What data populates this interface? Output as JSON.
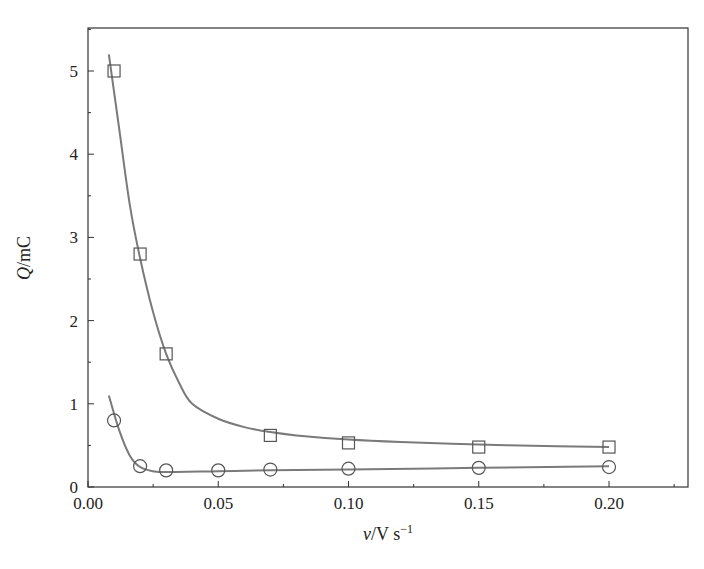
{
  "chart_data": {
    "type": "scatter",
    "title": "",
    "xlabel": "v/V s-1",
    "xlabel_parts": {
      "var": "ν",
      "unit": "/V s",
      "sup": "−1"
    },
    "ylabel": "Q/mC",
    "ylabel_parts": {
      "var": "Q",
      "unit": "/mC"
    },
    "xlim": [
      0.0,
      0.225
    ],
    "ylim": [
      0,
      5.5
    ],
    "xticks": [
      "0.00",
      "0.05",
      "0.10",
      "0.15",
      "0.20"
    ],
    "yticks": [
      "0",
      "1",
      "2",
      "3",
      "4",
      "5"
    ],
    "grid": false,
    "legend": null,
    "series": [
      {
        "name": "squares",
        "marker": "square",
        "x": [
          0.01,
          0.02,
          0.03,
          0.07,
          0.1,
          0.15,
          0.2
        ],
        "y": [
          5.0,
          2.8,
          1.6,
          0.62,
          0.53,
          0.48,
          0.48
        ],
        "fit": [
          [
            0.008,
            5.2
          ],
          [
            0.012,
            4.3
          ],
          [
            0.016,
            3.4
          ],
          [
            0.02,
            2.75
          ],
          [
            0.025,
            2.1
          ],
          [
            0.03,
            1.6
          ],
          [
            0.035,
            1.25
          ],
          [
            0.04,
            1.0
          ],
          [
            0.05,
            0.82
          ],
          [
            0.06,
            0.72
          ],
          [
            0.07,
            0.66
          ],
          [
            0.08,
            0.62
          ],
          [
            0.1,
            0.57
          ],
          [
            0.12,
            0.54
          ],
          [
            0.15,
            0.51
          ],
          [
            0.18,
            0.49
          ],
          [
            0.2,
            0.48
          ]
        ]
      },
      {
        "name": "circles",
        "marker": "circle",
        "x": [
          0.01,
          0.02,
          0.03,
          0.05,
          0.07,
          0.1,
          0.15,
          0.2
        ],
        "y": [
          0.8,
          0.25,
          0.2,
          0.2,
          0.21,
          0.22,
          0.23,
          0.24
        ],
        "fit": [
          [
            0.008,
            1.1
          ],
          [
            0.012,
            0.68
          ],
          [
            0.016,
            0.38
          ],
          [
            0.02,
            0.24
          ],
          [
            0.025,
            0.19
          ],
          [
            0.03,
            0.18
          ],
          [
            0.05,
            0.19
          ],
          [
            0.07,
            0.2
          ],
          [
            0.1,
            0.21
          ],
          [
            0.15,
            0.23
          ],
          [
            0.2,
            0.25
          ]
        ]
      }
    ]
  }
}
